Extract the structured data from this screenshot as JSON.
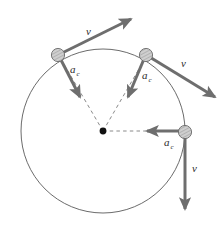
{
  "figure": {
    "colors": {
      "background": "#ffffff",
      "circle_stroke": "#555555",
      "vector": "#6e6e6e",
      "dashed": "#8a8a8a",
      "center_dot": "#111111",
      "ball_fill": "#c9c9c9",
      "ball_stroke": "#6a6a6a",
      "text": "#2b2b2b"
    },
    "circle": {
      "center_x": 103,
      "center_y": 131,
      "radius": 82
    },
    "center_point": {
      "x": 103,
      "y": 131
    },
    "particles": [
      {
        "id": "particle-top-left",
        "x": 58,
        "y": 55,
        "velocity": {
          "label": "v",
          "subscript": "",
          "from_x": 58,
          "from_y": 55,
          "to_x": 131,
          "to_y": 19,
          "label_x": 86,
          "label_y": 35
        },
        "acceleration": {
          "label": "a",
          "subscript": "c",
          "from_x": 60,
          "from_y": 58,
          "to_x": 80,
          "to_y": 97,
          "label_x": 70,
          "label_y": 73,
          "sub_x": 79,
          "sub_y": 76
        }
      },
      {
        "id": "particle-top-right",
        "x": 146,
        "y": 55,
        "velocity": {
          "label": "v",
          "subscript": "",
          "from_x": 148,
          "from_y": 56,
          "to_x": 215,
          "to_y": 97,
          "label_x": 181,
          "label_y": 67
        },
        "acceleration": {
          "label": "a",
          "subscript": "c",
          "from_x": 144,
          "from_y": 59,
          "to_x": 128,
          "to_y": 97,
          "label_x": 142,
          "label_y": 79,
          "sub_x": 151,
          "sub_y": 82
        }
      },
      {
        "id": "particle-right",
        "x": 185,
        "y": 132,
        "velocity": {
          "label": "v",
          "subscript": "",
          "from_x": 185,
          "from_y": 134,
          "to_x": 185,
          "to_y": 209,
          "label_x": 192,
          "label_y": 170
        },
        "acceleration": {
          "label": "a",
          "subscript": "c",
          "from_x": 182,
          "from_y": 131,
          "to_x": 147,
          "to_y": 131,
          "label_x": 165,
          "label_y": 145,
          "sub_x": 174,
          "sub_y": 148
        }
      }
    ],
    "radii_dashed": [
      {
        "from_x": 103,
        "from_y": 131,
        "to_x": 60,
        "to_y": 58
      },
      {
        "from_x": 103,
        "from_y": 131,
        "to_x": 144,
        "to_y": 59
      },
      {
        "from_x": 103,
        "from_y": 131,
        "to_x": 182,
        "to_y": 131
      }
    ]
  }
}
